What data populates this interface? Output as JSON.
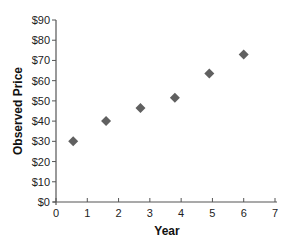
{
  "chart_data": {
    "type": "scatter",
    "title": "",
    "xlabel": "Year",
    "ylabel": "Observed Price",
    "xlim": [
      0,
      7
    ],
    "ylim": [
      0,
      90
    ],
    "x_ticks": [
      0,
      1,
      2,
      3,
      4,
      5,
      6,
      7
    ],
    "x_tick_labels": [
      "0",
      "1",
      "2",
      "3",
      "4",
      "5",
      "6",
      "7"
    ],
    "y_ticks": [
      0,
      10,
      20,
      30,
      40,
      50,
      60,
      70,
      80,
      90
    ],
    "y_tick_labels": [
      "$0",
      "$10",
      "$20",
      "$30",
      "$40",
      "$50",
      "$60",
      "$70",
      "$80",
      "$90"
    ],
    "grid": false,
    "legend": null,
    "marker": "diamond",
    "marker_color": "#606060",
    "series": [
      {
        "name": "Observed Price",
        "points": [
          {
            "x": 0.55,
            "y": 30
          },
          {
            "x": 1.6,
            "y": 40
          },
          {
            "x": 2.7,
            "y": 46.5
          },
          {
            "x": 3.8,
            "y": 51.5
          },
          {
            "x": 4.9,
            "y": 63.5
          },
          {
            "x": 6.0,
            "y": 73
          }
        ]
      }
    ]
  }
}
